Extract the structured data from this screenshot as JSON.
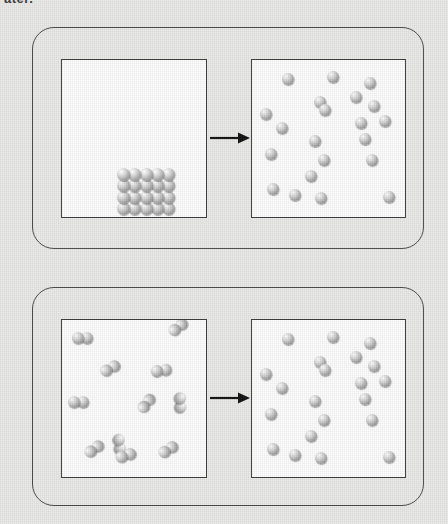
{
  "page": {
    "clipped_caption_text": "ater.",
    "background_color": "#e9e9e7",
    "width": 448,
    "height": 524
  },
  "palette": {
    "panel_border": "#4a4a4a",
    "box_border": "#3c3c3c",
    "box_fill": "#fdfdfd",
    "arrow_color": "#111111",
    "sphere_light": "#ffffff",
    "sphere_mid": "#c8c8c8",
    "sphere_dark": "#757575"
  },
  "chart_data": {
    "type": "diagram",
    "panels": [
      {
        "id": "solid-to-gas",
        "label": "Solid crystal lattice converting to a gas",
        "arrow": "right-arrow",
        "before": {
          "label": "ordered solid lattice",
          "particle_type": "single-atom",
          "arrangement": "close-packed grid",
          "grid_columns": 5,
          "grid_rows": 4,
          "count": 20,
          "sphere_diameter_px": 13
        },
        "after": {
          "label": "dispersed gas atoms",
          "particle_type": "single-atom",
          "arrangement": "random",
          "count": 21,
          "sphere_diameter_px": 12,
          "positions": [
            [
              30,
              13
            ],
            [
              75,
              11
            ],
            [
              112,
              17
            ],
            [
              62,
              36
            ],
            [
              98,
              31
            ],
            [
              116,
              40
            ],
            [
              8,
              48
            ],
            [
              67,
              44
            ],
            [
              103,
              57
            ],
            [
              127,
              55
            ],
            [
              24,
              62
            ],
            [
              57,
              75
            ],
            [
              107,
              73
            ],
            [
              13,
              88
            ],
            [
              66,
              94
            ],
            [
              53,
              110
            ],
            [
              114,
              94
            ],
            [
              15,
              123
            ],
            [
              37,
              129
            ],
            [
              63,
              132
            ],
            [
              131,
              131
            ]
          ]
        }
      },
      {
        "id": "diatomic-to-atomic",
        "label": "Diatomic molecules dissociating into individual atoms",
        "arrow": "right-arrow",
        "before": {
          "label": "diatomic molecules",
          "particle_type": "diatomic-molecule",
          "arrangement": "random",
          "count": 11,
          "sphere_diameter_px": 12,
          "molecules": [
            {
              "x": 10,
              "y": 12,
              "angle": 0
            },
            {
              "x": 104,
              "y": 9,
              "angle": -38
            },
            {
              "x": 36,
              "y": 48,
              "angle": -28
            },
            {
              "x": 88,
              "y": 46,
              "angle": -8
            },
            {
              "x": 6,
              "y": 76,
              "angle": 0
            },
            {
              "x": 124,
              "y": 72,
              "angle": 88
            },
            {
              "x": 73,
              "y": 88,
              "angle": -52
            },
            {
              "x": 62,
              "y": 113,
              "angle": 82
            },
            {
              "x": 20,
              "y": 130,
              "angle": -35
            },
            {
              "x": 94,
              "y": 130,
              "angle": -32
            },
            {
              "x": 52,
              "y": 133,
              "angle": -18
            }
          ]
        },
        "after": {
          "label": "free individual atoms",
          "particle_type": "single-atom",
          "arrangement": "random",
          "count": 21,
          "sphere_diameter_px": 12,
          "positions": [
            [
              30,
              13
            ],
            [
              75,
              11
            ],
            [
              112,
              17
            ],
            [
              62,
              36
            ],
            [
              98,
              31
            ],
            [
              116,
              40
            ],
            [
              8,
              48
            ],
            [
              67,
              44
            ],
            [
              103,
              57
            ],
            [
              127,
              55
            ],
            [
              24,
              62
            ],
            [
              57,
              75
            ],
            [
              107,
              73
            ],
            [
              13,
              88
            ],
            [
              66,
              94
            ],
            [
              53,
              110
            ],
            [
              114,
              94
            ],
            [
              15,
              123
            ],
            [
              37,
              129
            ],
            [
              63,
              132
            ],
            [
              131,
              131
            ]
          ]
        }
      }
    ]
  }
}
